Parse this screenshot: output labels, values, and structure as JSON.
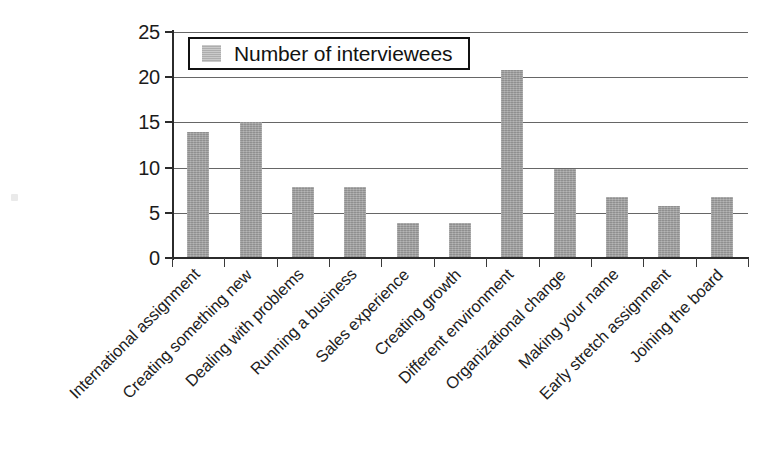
{
  "chart_data": {
    "type": "bar",
    "title": "",
    "subtitle": "",
    "xlabel": "",
    "ylabel": "",
    "ylim": [
      0,
      25
    ],
    "ytick_values": [
      0,
      5,
      10,
      15,
      20,
      25
    ],
    "ytick_labels": [
      "0",
      "5",
      "10",
      "15",
      "20",
      "25"
    ],
    "grid": true,
    "grid_axis": "y",
    "legend": {
      "position": "top-left inside plot",
      "entries": [
        {
          "label": "Number of interviewees",
          "color": "#9d9d9d"
        }
      ]
    },
    "categories": [
      "International assignment",
      "Creating something new",
      "Dealing with problems",
      "Running a business",
      "Sales experience",
      "Creating growth",
      "Different environment",
      "Organizational change",
      "Making your name",
      "Early stretch assignment",
      "Joining the board"
    ],
    "series": [
      {
        "name": "Number of interviewees",
        "color": "#9d9d9d",
        "values": [
          13.9,
          15.0,
          7.9,
          7.9,
          3.9,
          3.9,
          20.8,
          9.8,
          6.8,
          5.7,
          6.7
        ]
      }
    ],
    "bar_color": "#9d9d9d",
    "axis_color": "#2b2b2b",
    "gridline_color": "#5a5a5a",
    "background_color": "#ffffff"
  },
  "axis": {
    "y_ticks": [
      "0",
      "5",
      "10",
      "15",
      "20",
      "25"
    ]
  },
  "legend": {
    "label": "Number of interviewees"
  },
  "categories": [
    "International assignment",
    "Creating something new",
    "Dealing with problems",
    "Running a business",
    "Sales experience",
    "Creating growth",
    "Different environment",
    "Organizational change",
    "Making your name",
    "Early stretch assignment",
    "Joining the board"
  ]
}
